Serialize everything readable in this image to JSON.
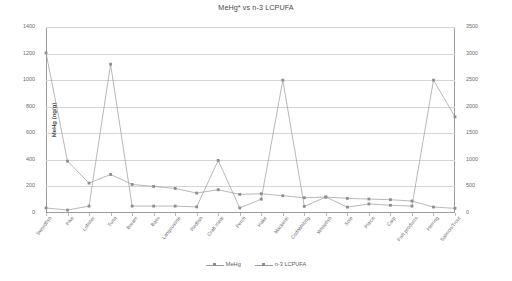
{
  "chart_data": {
    "type": "line",
    "title": "MeHg* vs n-3 LCPUFA",
    "xlabel": "",
    "ylabel": "MeHg (ng/g)",
    "y2label": "n-3 LCPUFA (mg/100g)",
    "ylim": [
      0,
      1400
    ],
    "y2lim": [
      0,
      3500
    ],
    "yticks": [
      0,
      200,
      400,
      600,
      800,
      1000,
      1200,
      1400
    ],
    "y2ticks": [
      0,
      500,
      1000,
      1500,
      2000,
      2500,
      3000,
      3500
    ],
    "grid": true,
    "legend_position": "bottom",
    "categories": [
      "Swordfish",
      "Pike",
      "Lobster",
      "Tuna",
      "Bream",
      "Bass",
      "Langoustine",
      "Redfish",
      "Crab meat",
      "Perch",
      "Hake",
      "Mackerel",
      "Cod/Whiting",
      "Whitefish",
      "Sole",
      "Plaice",
      "Carp",
      "Fish products",
      "Herring",
      "Salmon/Trout"
    ],
    "series": [
      {
        "name": "MeHg",
        "axis": "left",
        "unit": "ng/g",
        "values": [
          1205,
          390,
          225,
          290,
          215,
          200,
          185,
          150,
          175,
          140,
          145,
          130,
          115,
          120,
          110,
          105,
          100,
          90,
          45,
          35
        ]
      },
      {
        "name": "n-3 LCPUFA",
        "axis": "right",
        "unit": "mg/100g",
        "values": [
          95,
          55,
          130,
          2800,
          130,
          130,
          130,
          115,
          990,
          95,
          260,
          2500,
          125,
          300,
          110,
          170,
          145,
          130,
          2500,
          1810
        ]
      }
    ]
  },
  "legend": {
    "items": [
      {
        "label": "MeHg"
      },
      {
        "label": "n-3 LCPUFA"
      }
    ]
  }
}
